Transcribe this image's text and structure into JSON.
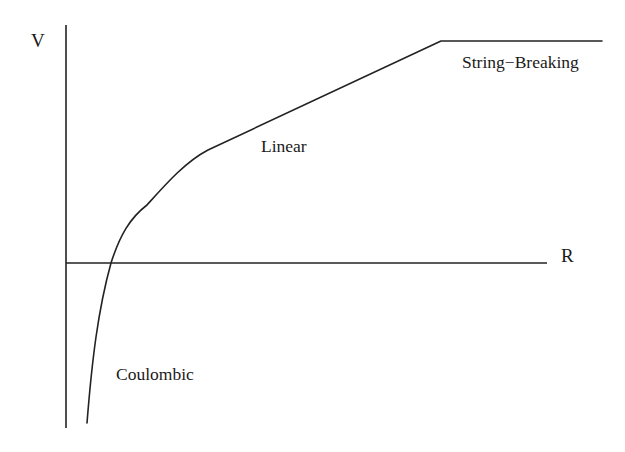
{
  "diagram": {
    "type": "potential-vs-distance schematic",
    "axes": {
      "y_label": "V",
      "x_label": "R"
    },
    "regions": [
      {
        "id": "coulombic",
        "label": "Coulombic"
      },
      {
        "id": "linear",
        "label": "Linear"
      },
      {
        "id": "string-breaking",
        "label": "String−Breaking"
      }
    ],
    "colors": {
      "line": "#222222",
      "text": "#1a1a1a",
      "background": "#ffffff"
    }
  }
}
